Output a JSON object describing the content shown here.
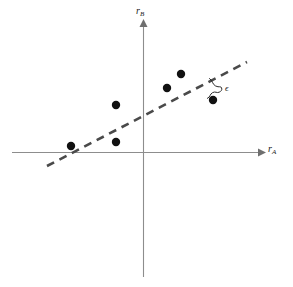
{
  "figure": {
    "background_color": "#ffffff",
    "width": 293,
    "height": 287,
    "axis_color": "#8d8d8d",
    "point_color": "#111111",
    "fit_line_color": "#4a4a4a"
  },
  "labels": {
    "y_axis_symbol": "r",
    "y_axis_subscript": "B",
    "x_axis_symbol": "r",
    "x_axis_subscript": "A",
    "residual_symbol": "ϵ"
  },
  "chart_data": {
    "type": "scatter",
    "title": "",
    "xlabel": "rA",
    "ylabel": "rB",
    "grid": false,
    "legend": null,
    "axes": {
      "origin_px": [
        143,
        152
      ],
      "x_axis_px": {
        "start": [
          12,
          152
        ],
        "end": [
          262,
          152
        ],
        "arrow": "right"
      },
      "y_axis_px": {
        "start": [
          143,
          277
        ],
        "end": [
          143,
          22
        ],
        "arrow": "up"
      },
      "x_range_note": "unlabelled, both positive and negative",
      "y_range_note": "unlabelled, both positive and negative"
    },
    "points_px": [
      {
        "x": 71,
        "y": 146
      },
      {
        "x": 116,
        "y": 105
      },
      {
        "x": 116,
        "y": 142
      },
      {
        "x": 167,
        "y": 88
      },
      {
        "x": 181,
        "y": 74
      },
      {
        "x": 213,
        "y": 100
      }
    ],
    "x": [
      -2.88,
      -1.08,
      -1.08,
      0.96,
      1.52,
      2.8
    ],
    "y": [
      0.24,
      1.88,
      0.4,
      2.56,
      3.12,
      2.08
    ],
    "fit_line": {
      "style": "dashed",
      "start_px": [
        47,
        166
      ],
      "end_px": [
        247,
        62
      ],
      "slope_px": -0.52,
      "description": "least-squares regression line of rB on rA"
    },
    "annotations": [
      {
        "name": "residual",
        "text": "ϵ",
        "label_px": [
          226,
          89
        ],
        "points_to_px": [
          213,
          100
        ],
        "from_line_px": [
          208,
          80
        ],
        "description": "curly brace marking vertical residual between fitted line and data point"
      }
    ]
  }
}
